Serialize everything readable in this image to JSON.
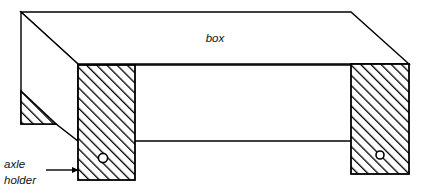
{
  "diagram": {
    "background_color": "#ffffff",
    "line_color": "#000000",
    "hatch_color": "#000000",
    "labels": {
      "box": {
        "text": "box",
        "x": 215,
        "y": 42
      },
      "callout": {
        "line1": "axle",
        "line2": "holder",
        "x": 4,
        "y1": 168,
        "y2": 184,
        "arrow_from_x": 46,
        "arrow_to_x": 78,
        "arrow_y": 170
      }
    },
    "geometry": {
      "top_face": "21,12 351,12 409,64 78,64",
      "left_side_face": "21,12 78,64 78,141 56,124 21,124 21,92",
      "front_face_top_edge": "78,66 409,66",
      "front_face_bottom_edge": "78,141 351,141",
      "left_pillar": {
        "x": 78,
        "y": 66,
        "width": 57,
        "height": 114
      },
      "right_pillar": {
        "x": 351,
        "y": 64,
        "width": 58,
        "height": 110
      },
      "left_triangle": "21,91 56,124 21,124",
      "left_axle_hole": {
        "cx": 103,
        "cy": 158,
        "r": 4.5
      },
      "right_axle_hole": {
        "cx": 380,
        "cy": 155,
        "r": 4.0
      }
    }
  }
}
